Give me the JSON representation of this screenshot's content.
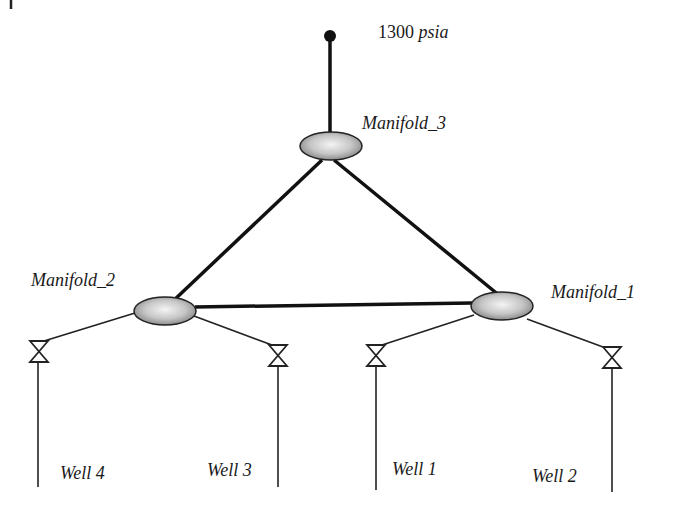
{
  "diagram": {
    "type": "pipeline-network",
    "source": {
      "pressure_value": "1300",
      "pressure_unit": "psia"
    },
    "manifolds": [
      {
        "id": "m3",
        "label": "Manifold_3"
      },
      {
        "id": "m2",
        "label": "Manifold_2"
      },
      {
        "id": "m1",
        "label": "Manifold_1"
      }
    ],
    "wells": [
      {
        "id": "w4",
        "label": "Well 4",
        "connects_to": "Manifold_2"
      },
      {
        "id": "w3",
        "label": "Well 3",
        "connects_to": "Manifold_2"
      },
      {
        "id": "w1",
        "label": "Well 1",
        "connects_to": "Manifold_1"
      },
      {
        "id": "w2",
        "label": "Well 2",
        "connects_to": "Manifold_1"
      }
    ],
    "connections": [
      [
        "source",
        "Manifold_3"
      ],
      [
        "Manifold_3",
        "Manifold_2"
      ],
      [
        "Manifold_3",
        "Manifold_1"
      ],
      [
        "Manifold_2",
        "Manifold_1"
      ]
    ],
    "colors": {
      "line": "#111111",
      "manifold_fill_center": "#f0f0f0",
      "manifold_fill_edge": "#8a8a8a"
    }
  }
}
